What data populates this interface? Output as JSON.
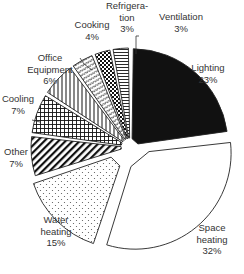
{
  "chart_data": {
    "type": "pie",
    "title": "",
    "start": "top",
    "direction": "clockwise",
    "slices": [
      {
        "label": "Lighting",
        "value": 23,
        "pct_text": "23%",
        "pattern": "solid-black",
        "exploded": false
      },
      {
        "label": "Space heating",
        "value": 32,
        "pct_text": "32%",
        "pattern": "white",
        "exploded": true,
        "label_lines": [
          "Space",
          "heating"
        ]
      },
      {
        "label": "Water heating",
        "value": 15,
        "pct_text": "15%",
        "pattern": "dots",
        "exploded": true,
        "label_lines": [
          "Water",
          "heating"
        ]
      },
      {
        "label": "Other",
        "value": 7,
        "pct_text": "7%",
        "pattern": "diagonal-stripes",
        "exploded": false
      },
      {
        "label": "Cooling",
        "value": 7,
        "pct_text": "7%",
        "pattern": "grid",
        "exploded": false
      },
      {
        "label": "Office Equipment",
        "value": 6,
        "pct_text": "6%",
        "pattern": "vertical-stripes",
        "exploded": false,
        "label_lines": [
          "Office",
          "Equipment"
        ]
      },
      {
        "label": "Cooking",
        "value": 4,
        "pct_text": "4%",
        "pattern": "zigzag",
        "exploded": false
      },
      {
        "label": "Refrigeration",
        "value": 3,
        "pct_text": "3%",
        "pattern": "checkerboard",
        "exploded": false,
        "label_lines": [
          "Refrigera-",
          "tion"
        ]
      },
      {
        "label": "Ventilation",
        "value": 3,
        "pct_text": "3%",
        "pattern": "horizontal-stripes",
        "exploded": false
      }
    ],
    "colors": {
      "stroke": "#222222",
      "fill_dark": "#111111",
      "background": "#ffffff",
      "label": "#333333"
    }
  }
}
